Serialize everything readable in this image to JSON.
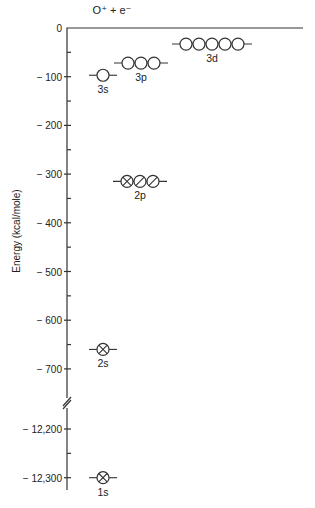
{
  "chart_data": {
    "type": "energy_level_diagram",
    "title": "O⁺ + e⁻",
    "ylabel": "Energy (kcal/mole)",
    "xlabel": "",
    "axis_break": {
      "between": [
        -700,
        -12200
      ]
    },
    "ticks_upper": [
      {
        "value": 0,
        "label": "0"
      },
      {
        "value": -100,
        "label": "− 100"
      },
      {
        "value": -200,
        "label": "− 200"
      },
      {
        "value": -300,
        "label": "− 300"
      },
      {
        "value": -400,
        "label": "− 400"
      },
      {
        "value": -500,
        "label": "− 500"
      },
      {
        "value": -600,
        "label": "− 600"
      },
      {
        "value": -700,
        "label": "− 700"
      }
    ],
    "ticks_lower": [
      {
        "value": -12200,
        "label": "− 12,200"
      },
      {
        "value": -12300,
        "label": "− 12,300"
      }
    ],
    "levels": [
      {
        "name": "1s",
        "energy": -12300,
        "orbitals": 1,
        "occupancy": [
          "full"
        ]
      },
      {
        "name": "2s",
        "energy": -660,
        "orbitals": 1,
        "occupancy": [
          "full"
        ]
      },
      {
        "name": "2p",
        "energy": -315,
        "orbitals": 3,
        "occupancy": [
          "full",
          "half",
          "half"
        ]
      },
      {
        "name": "3s",
        "energy": -97,
        "orbitals": 1,
        "occupancy": [
          "empty"
        ]
      },
      {
        "name": "3p",
        "energy": -72,
        "orbitals": 3,
        "occupancy": [
          "empty",
          "empty",
          "empty"
        ]
      },
      {
        "name": "3d",
        "energy": -33,
        "orbitals": 5,
        "occupancy": [
          "empty",
          "empty",
          "empty",
          "empty",
          "empty"
        ]
      }
    ],
    "layout": {
      "grid": false,
      "legend": "none"
    }
  },
  "layout_px": {
    "axis_x": 67,
    "y0": 28,
    "px_per_100": 48.7,
    "lower_ref_value": -12200,
    "lower_ref_y": 429,
    "top_line_end_x": 303,
    "axis_bottom_y": 490,
    "break_y": 398,
    "level_x": {
      "1s": 103,
      "2s": 103,
      "2p": 127,
      "3s": 103,
      "3p": 128,
      "3d": 186
    },
    "orbital_r": 6,
    "orbital_gap": 13
  }
}
